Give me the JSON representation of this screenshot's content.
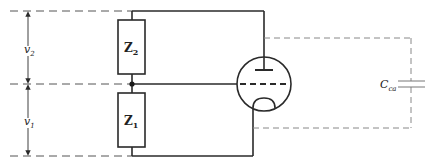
{
  "diagram": {
    "type": "circuit-schematic",
    "colors": {
      "wire": "#2a2a2a",
      "dashed": "#555555",
      "capacitor_dashed": "#888888",
      "background": "#ffffff"
    },
    "labels": {
      "v2": "v",
      "v2_sub": "2",
      "v1": "v",
      "v1_sub": "1",
      "z2": "Z",
      "z2_sub": "2",
      "z1": "Z",
      "z1_sub": "1",
      "cca": "C",
      "cca_sub": "ca"
    },
    "components": [
      {
        "id": "Z2",
        "kind": "impedance",
        "label": "Z2"
      },
      {
        "id": "Z1",
        "kind": "impedance",
        "label": "Z1"
      },
      {
        "id": "tube",
        "kind": "triode",
        "electrodes": [
          "anode",
          "grid",
          "cathode"
        ]
      },
      {
        "id": "Cca",
        "kind": "capacitor",
        "label": "C_ca"
      }
    ],
    "dimension_arrows": [
      {
        "label": "v2",
        "from": "top",
        "to": "middle"
      },
      {
        "label": "v1",
        "from": "middle",
        "to": "bottom"
      }
    ]
  }
}
